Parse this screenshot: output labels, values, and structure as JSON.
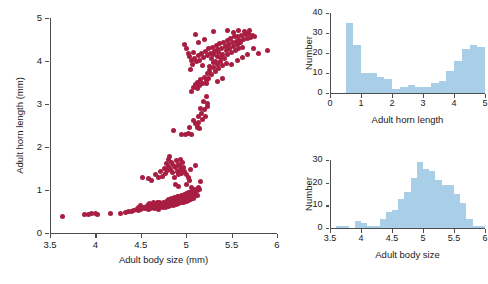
{
  "figure": {
    "marker_color": "#A81E42",
    "bar_color": "#A8CEE8",
    "axis_color": "#4d4d4d"
  },
  "chart_data": [
    {
      "id": "scatter",
      "type": "scatter",
      "title": "",
      "xlabel": "Adult body size (mm)",
      "ylabel": "Adult horn length (mm)",
      "xlim": [
        3.5,
        6
      ],
      "ylim": [
        0,
        5
      ],
      "xticks": [
        3.5,
        4,
        4.5,
        5,
        5.5,
        6
      ],
      "xticklabels": [
        "3.5",
        "4",
        "4.5",
        "5",
        "5.5",
        "6"
      ],
      "yticks": [
        0,
        1,
        2,
        3,
        4,
        5
      ],
      "yticklabels": [
        "0",
        "1",
        "2",
        "3",
        "4",
        "5"
      ],
      "grid": false,
      "legend": "none",
      "points": [
        [
          3.64,
          0.38
        ],
        [
          3.88,
          0.44
        ],
        [
          3.92,
          0.44
        ],
        [
          3.96,
          0.45
        ],
        [
          4.0,
          0.45
        ],
        [
          4.02,
          0.44
        ],
        [
          4.17,
          0.46
        ],
        [
          4.28,
          0.45
        ],
        [
          4.33,
          0.47
        ],
        [
          4.36,
          0.5
        ],
        [
          4.4,
          0.5
        ],
        [
          4.42,
          0.52
        ],
        [
          4.45,
          0.55
        ],
        [
          4.47,
          0.52
        ],
        [
          4.48,
          0.6
        ],
        [
          4.5,
          0.55
        ],
        [
          4.5,
          0.63
        ],
        [
          4.52,
          0.57
        ],
        [
          4.53,
          0.6
        ],
        [
          4.55,
          0.56
        ],
        [
          4.56,
          0.62
        ],
        [
          4.57,
          0.58
        ],
        [
          4.58,
          0.66
        ],
        [
          4.58,
          0.55
        ],
        [
          4.6,
          0.6
        ],
        [
          4.6,
          0.68
        ],
        [
          4.61,
          0.57
        ],
        [
          4.62,
          0.64
        ],
        [
          4.63,
          0.6
        ],
        [
          4.64,
          0.7
        ],
        [
          4.65,
          0.58
        ],
        [
          4.66,
          0.65
        ],
        [
          4.67,
          0.62
        ],
        [
          4.68,
          0.72
        ],
        [
          4.68,
          0.58
        ],
        [
          4.7,
          0.64
        ],
        [
          4.7,
          0.55
        ],
        [
          4.71,
          0.7
        ],
        [
          4.72,
          0.62
        ],
        [
          4.73,
          0.66
        ],
        [
          4.74,
          0.6
        ],
        [
          4.75,
          0.72
        ],
        [
          4.75,
          0.63
        ],
        [
          4.76,
          0.68
        ],
        [
          4.77,
          0.6
        ],
        [
          4.78,
          0.74
        ],
        [
          4.78,
          0.64
        ],
        [
          4.79,
          0.7
        ],
        [
          4.8,
          0.62
        ],
        [
          4.8,
          0.78
        ],
        [
          4.81,
          0.66
        ],
        [
          4.82,
          0.72
        ],
        [
          4.83,
          0.63
        ],
        [
          4.84,
          0.8
        ],
        [
          4.85,
          0.68
        ],
        [
          4.85,
          0.74
        ],
        [
          4.86,
          0.64
        ],
        [
          4.87,
          0.82
        ],
        [
          4.88,
          0.7
        ],
        [
          4.88,
          0.76
        ],
        [
          4.89,
          0.66
        ],
        [
          4.9,
          0.84
        ],
        [
          4.9,
          0.72
        ],
        [
          4.91,
          0.78
        ],
        [
          4.92,
          0.68
        ],
        [
          4.93,
          0.86
        ],
        [
          4.93,
          0.74
        ],
        [
          4.94,
          0.8
        ],
        [
          4.95,
          0.7
        ],
        [
          4.95,
          0.88
        ],
        [
          4.96,
          0.76
        ],
        [
          4.97,
          0.82
        ],
        [
          4.97,
          0.72
        ],
        [
          4.98,
          0.9
        ],
        [
          4.99,
          0.78
        ],
        [
          4.99,
          0.84
        ],
        [
          5.0,
          0.74
        ],
        [
          5.0,
          0.92
        ],
        [
          5.01,
          0.8
        ],
        [
          5.02,
          0.86
        ],
        [
          5.02,
          0.76
        ],
        [
          5.03,
          0.94
        ],
        [
          5.04,
          0.82
        ],
        [
          5.04,
          0.88
        ],
        [
          5.05,
          0.78
        ],
        [
          5.06,
          0.96
        ],
        [
          5.06,
          0.84
        ],
        [
          5.07,
          0.9
        ],
        [
          5.08,
          0.8
        ],
        [
          5.08,
          0.98
        ],
        [
          5.09,
          0.86
        ],
        [
          5.1,
          0.92
        ],
        [
          5.1,
          1.02
        ],
        [
          5.12,
          0.88
        ],
        [
          5.13,
          1.05
        ],
        [
          5.15,
          1.02
        ],
        [
          5.16,
          1.2
        ],
        [
          4.52,
          1.3
        ],
        [
          4.58,
          1.26
        ],
        [
          4.62,
          1.22
        ],
        [
          4.66,
          1.35
        ],
        [
          4.7,
          1.28
        ],
        [
          4.72,
          1.42
        ],
        [
          4.74,
          1.32
        ],
        [
          4.76,
          1.5
        ],
        [
          4.77,
          1.38
        ],
        [
          4.78,
          1.62
        ],
        [
          4.79,
          1.45
        ],
        [
          4.8,
          1.72
        ],
        [
          4.81,
          1.55
        ],
        [
          4.82,
          1.78
        ],
        [
          4.83,
          1.48
        ],
        [
          4.84,
          1.65
        ],
        [
          4.85,
          1.4
        ],
        [
          4.86,
          1.58
        ],
        [
          4.87,
          1.3
        ],
        [
          4.88,
          1.52
        ],
        [
          4.89,
          1.68
        ],
        [
          4.9,
          1.44
        ],
        [
          4.91,
          1.6
        ],
        [
          4.92,
          1.36
        ],
        [
          4.93,
          1.56
        ],
        [
          4.94,
          1.48
        ],
        [
          4.95,
          1.38
        ],
        [
          4.96,
          1.64
        ],
        [
          4.97,
          1.52
        ],
        [
          4.98,
          1.42
        ],
        [
          5.0,
          1.35
        ],
        [
          5.02,
          1.3
        ],
        [
          5.05,
          1.48
        ],
        [
          5.1,
          1.58
        ],
        [
          5.04,
          1.22
        ],
        [
          4.86,
          2.38
        ],
        [
          4.95,
          2.3
        ],
        [
          4.99,
          2.28
        ],
        [
          5.02,
          2.32
        ],
        [
          5.04,
          2.45
        ],
        [
          5.06,
          2.3
        ],
        [
          5.08,
          2.62
        ],
        [
          5.1,
          2.55
        ],
        [
          5.12,
          2.48
        ],
        [
          5.13,
          2.7
        ],
        [
          5.14,
          2.58
        ],
        [
          5.15,
          2.44
        ],
        [
          5.16,
          2.9
        ],
        [
          5.17,
          2.78
        ],
        [
          5.18,
          2.65
        ],
        [
          5.19,
          3.05
        ],
        [
          5.2,
          2.88
        ],
        [
          5.21,
          2.72
        ],
        [
          5.12,
          2.45
        ],
        [
          5.22,
          3.18
        ],
        [
          5.23,
          3.02
        ],
        [
          5.24,
          2.95
        ],
        [
          5.06,
          3.3
        ],
        [
          5.08,
          3.38
        ],
        [
          5.1,
          3.45
        ],
        [
          5.12,
          3.35
        ],
        [
          5.14,
          3.5
        ],
        [
          5.15,
          3.42
        ],
        [
          5.16,
          3.58
        ],
        [
          5.18,
          3.48
        ],
        [
          5.2,
          3.62
        ],
        [
          5.22,
          3.55
        ],
        [
          5.24,
          3.7
        ],
        [
          5.25,
          3.6
        ],
        [
          5.26,
          3.78
        ],
        [
          5.28,
          3.68
        ],
        [
          5.3,
          3.85
        ],
        [
          5.32,
          3.75
        ],
        [
          5.34,
          3.92
        ],
        [
          5.36,
          3.82
        ],
        [
          5.38,
          4.0
        ],
        [
          5.4,
          3.9
        ],
        [
          5.05,
          3.8
        ],
        [
          5.07,
          3.92
        ],
        [
          5.09,
          4.05
        ],
        [
          5.11,
          3.98
        ],
        [
          5.13,
          4.12
        ],
        [
          5.15,
          4.02
        ],
        [
          5.17,
          4.18
        ],
        [
          5.19,
          4.08
        ],
        [
          5.21,
          4.22
        ],
        [
          5.23,
          4.12
        ],
        [
          5.25,
          4.28
        ],
        [
          5.27,
          4.18
        ],
        [
          5.29,
          4.32
        ],
        [
          5.31,
          4.22
        ],
        [
          5.33,
          4.36
        ],
        [
          5.35,
          4.26
        ],
        [
          5.37,
          4.4
        ],
        [
          5.39,
          4.3
        ],
        [
          5.41,
          4.44
        ],
        [
          5.43,
          4.34
        ],
        [
          5.45,
          4.48
        ],
        [
          5.47,
          4.38
        ],
        [
          5.49,
          4.52
        ],
        [
          5.51,
          4.42
        ],
        [
          5.53,
          4.56
        ],
        [
          5.55,
          4.46
        ],
        [
          5.57,
          4.58
        ],
        [
          5.59,
          4.48
        ],
        [
          5.61,
          4.6
        ],
        [
          5.63,
          4.5
        ],
        [
          5.65,
          4.62
        ],
        [
          5.67,
          4.52
        ],
        [
          5.69,
          4.64
        ],
        [
          5.71,
          4.55
        ],
        [
          5.73,
          4.6
        ],
        [
          5.75,
          4.58
        ],
        [
          5.28,
          4.05
        ],
        [
          5.3,
          4.15
        ],
        [
          5.32,
          4.0
        ],
        [
          5.34,
          4.1
        ],
        [
          5.36,
          4.2
        ],
        [
          5.38,
          4.08
        ],
        [
          5.4,
          4.16
        ],
        [
          5.42,
          4.06
        ],
        [
          5.44,
          4.24
        ],
        [
          5.46,
          4.14
        ],
        [
          5.48,
          4.3
        ],
        [
          5.5,
          4.2
        ],
        [
          5.52,
          4.34
        ],
        [
          5.54,
          4.24
        ],
        [
          5.56,
          4.38
        ],
        [
          5.58,
          4.28
        ],
        [
          5.6,
          4.42
        ],
        [
          5.62,
          4.32
        ],
        [
          5.1,
          4.62
        ],
        [
          5.3,
          4.68
        ],
        [
          5.46,
          4.7
        ],
        [
          5.52,
          4.66
        ],
        [
          5.58,
          4.72
        ],
        [
          5.64,
          4.68
        ],
        [
          5.7,
          4.7
        ],
        [
          5.12,
          3.5
        ],
        [
          5.22,
          3.48
        ],
        [
          5.34,
          3.52
        ],
        [
          5.4,
          3.6
        ],
        [
          5.44,
          3.95
        ],
        [
          5.5,
          3.92
        ],
        [
          5.56,
          4.02
        ],
        [
          5.62,
          4.08
        ],
        [
          5.68,
          4.16
        ],
        [
          5.74,
          4.28
        ],
        [
          5.8,
          4.18
        ],
        [
          5.9,
          4.25
        ],
        [
          5.3,
          3.96
        ],
        [
          5.26,
          3.88
        ],
        [
          5.18,
          3.9
        ],
        [
          5.08,
          4.2
        ],
        [
          5.06,
          4.02
        ],
        [
          4.98,
          4.38
        ],
        [
          5.0,
          4.3
        ],
        [
          5.02,
          4.18
        ],
        [
          5.04,
          4.1
        ],
        [
          5.14,
          4.44
        ],
        [
          5.2,
          4.5
        ],
        [
          4.94,
          1.72
        ],
        [
          4.88,
          1.12
        ],
        [
          4.92,
          1.08
        ],
        [
          5.0,
          1.12
        ],
        [
          5.06,
          1.06
        ],
        [
          5.12,
          1.0
        ]
      ]
    },
    {
      "id": "hist-horn-length",
      "type": "bar",
      "title": "",
      "xlabel": "Adult horn length",
      "ylabel": "Number",
      "xlim": [
        0,
        5
      ],
      "ylim": [
        0,
        40
      ],
      "xticks": [
        0,
        1,
        2,
        3,
        4,
        5
      ],
      "xticklabels": [
        "0",
        "1",
        "2",
        "3",
        "4",
        "5"
      ],
      "yticks": [
        0,
        10,
        20,
        30,
        40
      ],
      "yticklabels": [
        "0",
        "10",
        "20",
        "30",
        "40"
      ],
      "grid": false,
      "legend": "none",
      "bin_width": 0.25,
      "bin_starts": [
        0.5,
        0.75,
        1.0,
        1.25,
        1.5,
        1.75,
        2.0,
        2.25,
        2.5,
        2.75,
        3.0,
        3.25,
        3.5,
        3.75,
        4.0,
        4.25,
        4.5,
        4.75
      ],
      "categories": [
        "0.5",
        "0.75",
        "1.0",
        "1.25",
        "1.5",
        "1.75",
        "2.0",
        "2.25",
        "2.5",
        "2.75",
        "3.0",
        "3.25",
        "3.5",
        "3.75",
        "4.0",
        "4.25",
        "4.5",
        "4.75"
      ],
      "values": [
        35,
        24,
        10,
        10,
        8,
        7,
        2,
        3,
        4,
        3,
        3,
        5,
        6,
        11,
        16,
        22,
        24,
        23,
        9
      ]
    },
    {
      "id": "hist-body-size",
      "type": "bar",
      "title": "",
      "xlabel": "Adult body size",
      "ylabel": "Number",
      "xlim": [
        3.5,
        6
      ],
      "ylim": [
        0,
        30
      ],
      "xticks": [
        3.5,
        4,
        4.5,
        5,
        5.5,
        6
      ],
      "xticklabels": [
        "3.5",
        "4",
        "4.5",
        "5",
        "5.5",
        "6"
      ],
      "yticks": [
        0,
        10,
        20,
        30
      ],
      "yticklabels": [
        "0",
        "10",
        "20",
        "30"
      ],
      "grid": false,
      "legend": "none",
      "bin_width": 0.1,
      "bin_starts": [
        3.6,
        3.7,
        3.8,
        3.9,
        4.0,
        4.1,
        4.2,
        4.3,
        4.4,
        4.5,
        4.6,
        4.7,
        4.8,
        4.9,
        5.0,
        5.1,
        5.2,
        5.3,
        5.4,
        5.5,
        5.6,
        5.7,
        5.8,
        5.9
      ],
      "categories": [
        "3.6",
        "3.7",
        "3.8",
        "3.9",
        "4.0",
        "4.1",
        "4.2",
        "4.3",
        "4.4",
        "4.5",
        "4.6",
        "4.7",
        "4.8",
        "4.9",
        "5.0",
        "5.1",
        "5.2",
        "5.3",
        "5.4",
        "5.5",
        "5.6",
        "5.7",
        "5.8",
        "5.9"
      ],
      "values": [
        1,
        1,
        0,
        3,
        2,
        1,
        1,
        4,
        7,
        8,
        13,
        16,
        22,
        29,
        26,
        25,
        21,
        19,
        19,
        15,
        11,
        4,
        1,
        1
      ]
    }
  ]
}
